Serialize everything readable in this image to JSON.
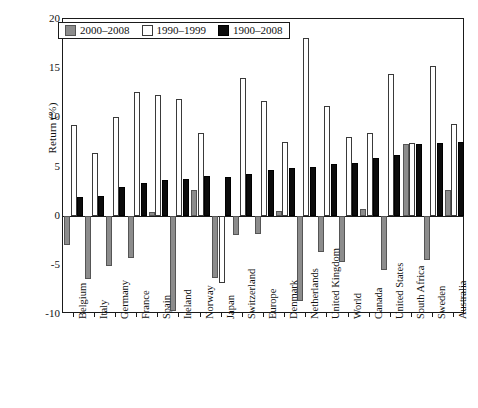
{
  "chart_data": {
    "type": "bar",
    "title": "",
    "xlabel": "",
    "ylabel": "Return (%)",
    "ylim": [
      -10,
      20
    ],
    "yticks": [
      20,
      15,
      10,
      5,
      0,
      -5,
      -10
    ],
    "grid": false,
    "legend_position": "top-left",
    "categories": [
      "Belgium",
      "Italy",
      "Germany",
      "France",
      "Spain",
      "Ireland",
      "Norway",
      "Japan",
      "Switzerland",
      "Europe",
      "Denmark",
      "Netherlands",
      "United Kingdom",
      "World",
      "Canada",
      "United States",
      "South Africa",
      "Sweden",
      "Australia"
    ],
    "series": [
      {
        "name": "2000–2008",
        "color": "#8c8c8c",
        "values": [
          -3.0,
          -6.4,
          -5.1,
          -4.3,
          0.4,
          -9.7,
          2.6,
          -6.3,
          -2.0,
          -1.9,
          0.5,
          -8.7,
          -3.7,
          -4.7,
          0.7,
          -5.5,
          7.3,
          -4.5,
          2.6
        ]
      },
      {
        "name": "1990–1999",
        "color": "#ffffff",
        "values": [
          9.2,
          6.4,
          10.0,
          12.6,
          12.3,
          11.9,
          8.4,
          -6.8,
          14.0,
          11.7,
          7.5,
          18.1,
          11.2,
          8.0,
          8.4,
          14.4,
          7.4,
          15.2,
          9.3
        ]
      },
      {
        "name": "1900–2008",
        "color": "#0c0c0c",
        "values": [
          1.9,
          2.0,
          2.9,
          3.3,
          3.6,
          3.7,
          4.0,
          3.9,
          4.2,
          4.6,
          4.8,
          4.9,
          5.3,
          5.4,
          5.9,
          6.2,
          7.3,
          7.4,
          7.5
        ]
      }
    ]
  }
}
